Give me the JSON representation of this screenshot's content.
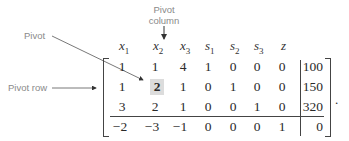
{
  "annotations": {
    "pivot": "Pivot",
    "pivot_column_line1": "Pivot",
    "pivot_column_line2": "column",
    "pivot_row": "Pivot row"
  },
  "headers": [
    "x1",
    "x2",
    "x3",
    "s1",
    "s2",
    "s3",
    "z"
  ],
  "header_parts": [
    {
      "var": "x",
      "sub": "1"
    },
    {
      "var": "x",
      "sub": "2"
    },
    {
      "var": "x",
      "sub": "3"
    },
    {
      "var": "s",
      "sub": "1"
    },
    {
      "var": "s",
      "sub": "2"
    },
    {
      "var": "s",
      "sub": "3"
    },
    {
      "var": "z",
      "sub": ""
    }
  ],
  "rows": [
    {
      "values": [
        "1",
        "1",
        "4",
        "1",
        "0",
        "0",
        "0"
      ],
      "rhs": "100"
    },
    {
      "values": [
        "1",
        "2",
        "1",
        "0",
        "1",
        "0",
        "0"
      ],
      "rhs": "150"
    },
    {
      "values": [
        "3",
        "2",
        "1",
        "0",
        "0",
        "1",
        "0"
      ],
      "rhs": "320"
    },
    {
      "values": [
        "−2",
        "−3",
        "−1",
        "0",
        "0",
        "0",
        "1"
      ],
      "rhs": "0"
    }
  ],
  "pivot_element": {
    "row": 1,
    "col": 1
  },
  "trailing_punctuation": "."
}
